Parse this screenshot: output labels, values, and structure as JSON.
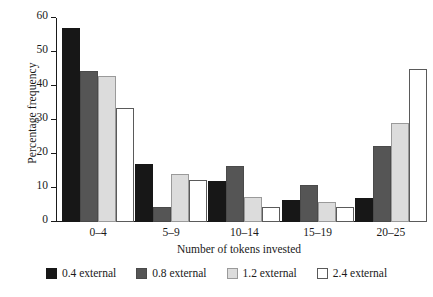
{
  "chart_data": {
    "type": "bar",
    "title": "",
    "xlabel": "Number of tokens invested",
    "ylabel": "Percentage frequency",
    "categories": [
      "0–4",
      "5–9",
      "10–14",
      "15–19",
      "20–25"
    ],
    "ylim": [
      0,
      60
    ],
    "yticks": [
      0,
      10,
      20,
      30,
      40,
      50,
      60
    ],
    "ytick_labels": [
      "0",
      "10",
      "20",
      "30",
      "40",
      "50",
      "60"
    ],
    "grid": false,
    "legend_position": "bottom",
    "series": [
      {
        "name": "0.4 external",
        "color": "#171717",
        "values": [
          57,
          17,
          12,
          6.5,
          7
        ]
      },
      {
        "name": "0.8 external",
        "color": "#555555",
        "values": [
          44.5,
          4.5,
          16.5,
          11,
          22.5
        ]
      },
      {
        "name": "1.2 external",
        "color": "#dcdcdc",
        "values": [
          43,
          14,
          7.5,
          5.8,
          29
        ]
      },
      {
        "name": "2.4 external",
        "color": "#ffffff",
        "values": [
          33.5,
          12.5,
          4.5,
          4.3,
          45
        ]
      }
    ]
  }
}
